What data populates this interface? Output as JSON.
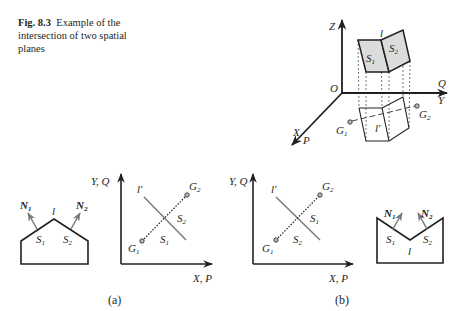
{
  "caption": {
    "figure_label": "Fig. 8.3",
    "text": "Example of the intersection of two spatial planes"
  },
  "colors": {
    "line": "#231f20",
    "face_fill": "#dcdcdc",
    "normal_arrow": "#7a7a7a",
    "projection_line": "#8a8a8a"
  },
  "diagram_3d": {
    "axes": {
      "z": "Z",
      "y": "Y",
      "q": "Q",
      "x": "X",
      "p": "P",
      "origin": "O"
    },
    "faces": {
      "s1": "S",
      "s1_sub": "1",
      "s2": "S",
      "s2_sub": "2",
      "edge": "l"
    },
    "projection": {
      "edge": "l′",
      "g1": "G",
      "g1_sub": "1",
      "g2": "G",
      "g2_sub": "2"
    }
  },
  "panel_a": {
    "label": "(a)",
    "profile": {
      "n1": "N",
      "n1_sub": "1",
      "n2": "N",
      "n2_sub": "2",
      "edge": "l",
      "s1": "S",
      "s1_sub": "1",
      "s2": "S",
      "s2_sub": "2"
    },
    "plan": {
      "y_axis": "Y, Q",
      "x_axis": "X, P",
      "edge": "l′",
      "g1": "G",
      "g1_sub": "1",
      "g2": "G",
      "g2_sub": "2",
      "s1": "S",
      "s1_sub": "1",
      "s2": "S",
      "s2_sub": "2"
    }
  },
  "panel_b": {
    "label": "(b)",
    "plan": {
      "y_axis": "Y, Q",
      "x_axis": "X, P",
      "edge": "l′",
      "g1": "G",
      "g1_sub": "1",
      "g2": "G",
      "g2_sub": "2",
      "s1": "S",
      "s1_sub": "1",
      "s2": "S",
      "s2_sub": "2"
    },
    "profile": {
      "n1": "N",
      "n1_sub": "1",
      "n2": "N",
      "n2_sub": "2",
      "edge": "l",
      "s1": "S",
      "s1_sub": "1",
      "s2": "S",
      "s2_sub": "2"
    }
  }
}
